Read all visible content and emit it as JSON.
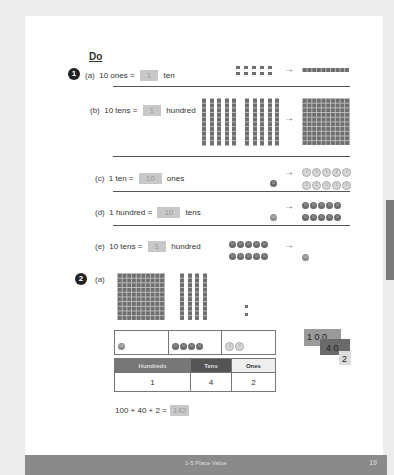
{
  "section": {
    "heading": "Do"
  },
  "problem1": {
    "number": "1",
    "parts": [
      {
        "label": "(a)",
        "lhs": "10 ones =",
        "answer": "1",
        "rhs": "ten"
      },
      {
        "label": "(b)",
        "lhs": "10 tens =",
        "answer": "1",
        "rhs": "hundred"
      },
      {
        "label": "(c)",
        "lhs": "1 ten =",
        "answer": "10",
        "rhs": "ones"
      },
      {
        "label": "(d)",
        "lhs": "1 hundred =",
        "answer": "10",
        "rhs": "tens"
      },
      {
        "label": "(e)",
        "lhs": "10 tens =",
        "answer": "1",
        "rhs": "hundred"
      }
    ],
    "arrow": "→",
    "disc_labels": {
      "one": "1",
      "ten": "10",
      "hundred": "100"
    }
  },
  "problem2": {
    "number": "2",
    "part_label": "(a)",
    "place_value_table": {
      "headers": [
        "Hundreds",
        "Tens",
        "Ones"
      ],
      "values": [
        "1",
        "4",
        "2"
      ]
    },
    "number_cards": [
      "1 0 0",
      "4 0",
      "2"
    ],
    "equation": {
      "lhs": "100 + 40 + 2 =",
      "answer": "142"
    }
  },
  "footer": {
    "title": "1-5 Place Value",
    "page_number": "19"
  }
}
